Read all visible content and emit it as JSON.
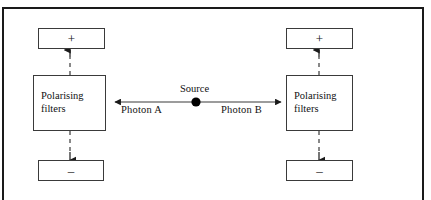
{
  "diagram": {
    "frame": {
      "border_color": "#1a1a1a"
    },
    "source": {
      "label": "Source",
      "marker": "filled-dot",
      "color": "#000000"
    },
    "photons": [
      {
        "id": "a",
        "label": "Photon  A",
        "direction": "left"
      },
      {
        "id": "b",
        "label": "Photon  B",
        "direction": "right"
      }
    ],
    "left_branch": {
      "plus_box": {
        "label": "+"
      },
      "filter_box": {
        "line1": "Polarising",
        "line2": "filters"
      },
      "minus_box": {
        "label": "–"
      }
    },
    "right_branch": {
      "plus_box": {
        "label": "+"
      },
      "filter_box": {
        "line1": "Polarising",
        "line2": "filters"
      },
      "minus_box": {
        "label": "–"
      }
    },
    "colors": {
      "box_stroke": "#3a3a3a",
      "line": "#3a3a3a",
      "text": "#111111",
      "background": "#ffffff"
    }
  }
}
